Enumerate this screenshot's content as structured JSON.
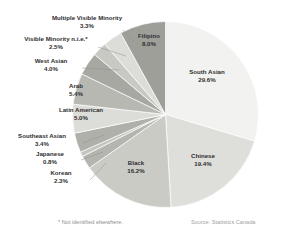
{
  "chart_data": {
    "type": "pie",
    "title": "",
    "subtitle": "",
    "xlabel": "",
    "ylabel": "",
    "legend_position": "none",
    "grid": false,
    "value_unit": "%",
    "start_angle_deg": 0,
    "direction": "clockwise",
    "categories": [
      "South Asian",
      "Chinese",
      "Black",
      "Korean",
      "Japanese",
      "Southeast Asian",
      "Latin American",
      "Arab",
      "West Asian",
      "Visible Minority n.i.e.*",
      "Multiple Visible Minority",
      "Filipino"
    ],
    "values": [
      29.6,
      19.4,
      16.2,
      2.3,
      0.8,
      3.4,
      5.0,
      5.4,
      4.0,
      2.5,
      3.3,
      8.0
    ],
    "slice_colors": [
      "#f2f2f0",
      "#dededa",
      "#cbcbc6",
      "#b5b5b0",
      "#c4c4bf",
      "#b0b0ab",
      "#dcdcd8",
      "#b8b8b3",
      "#a8a8a3",
      "#c9c9c4",
      "#dcdcd8",
      "#9f9f9a"
    ],
    "slices": [
      {
        "label": "South Asian",
        "percent_text": "29.6%",
        "value": 29.6,
        "label_placement": "inside"
      },
      {
        "label": "Chinese",
        "percent_text": "19.4%",
        "value": 19.4,
        "label_placement": "inside"
      },
      {
        "label": "Black",
        "percent_text": "16.2%",
        "value": 16.2,
        "label_placement": "inside"
      },
      {
        "label": "Korean",
        "percent_text": "2.3%",
        "value": 2.3,
        "label_placement": "outside-leader"
      },
      {
        "label": "Japanese",
        "percent_text": "0.8%",
        "value": 0.8,
        "label_placement": "outside-leader"
      },
      {
        "label": "Southeast Asian",
        "percent_text": "3.4%",
        "value": 3.4,
        "label_placement": "outside-leader"
      },
      {
        "label": "Latin American",
        "percent_text": "5.0%",
        "value": 5.0,
        "label_placement": "inside"
      },
      {
        "label": "Arab",
        "percent_text": "5.4%",
        "value": 5.4,
        "label_placement": "inside"
      },
      {
        "label": "West Asian",
        "percent_text": "4.0%",
        "value": 4.0,
        "label_placement": "outside-leader"
      },
      {
        "label": "Visible Minority n.i.e.*",
        "percent_text": "2.5%",
        "value": 2.5,
        "label_placement": "outside-leader"
      },
      {
        "label": "Multiple Visible Minority",
        "percent_text": "3.3%",
        "value": 3.3,
        "label_placement": "outside-leader"
      },
      {
        "label": "Filipino",
        "percent_text": "8.0%",
        "value": 8.0,
        "label_placement": "inside"
      }
    ]
  },
  "labels": {
    "multiple_visible_minority": {
      "name": "Multiple Visible Minority",
      "pct": "3.3%"
    },
    "visible_minority_nie": {
      "name": "Visible Minority n.i.e.*",
      "pct": "2.5%"
    },
    "west_asian": {
      "name": "West Asian",
      "pct": "4.0%"
    },
    "arab": {
      "name": "Arab",
      "pct": "5.4%"
    },
    "latin_american": {
      "name": "Latin American",
      "pct": "5.0%"
    },
    "southeast_asian": {
      "name": "Southeast Asian",
      "pct": "3.4%"
    },
    "japanese": {
      "name": "Japanese",
      "pct": "0.8%"
    },
    "korean": {
      "name": "Korean",
      "pct": "2.3%"
    },
    "black": {
      "name": "Black",
      "pct": "16.2%"
    },
    "filipino": {
      "name": "Filipino",
      "pct": "8.0%"
    },
    "south_asian": {
      "name": "South Asian",
      "pct": "29.6%"
    },
    "chinese": {
      "name": "Chinese",
      "pct": "19.4%"
    }
  },
  "footnotes": {
    "nie": "* Not identified elsewhere.",
    "source": "Source: Statistics Canada"
  }
}
